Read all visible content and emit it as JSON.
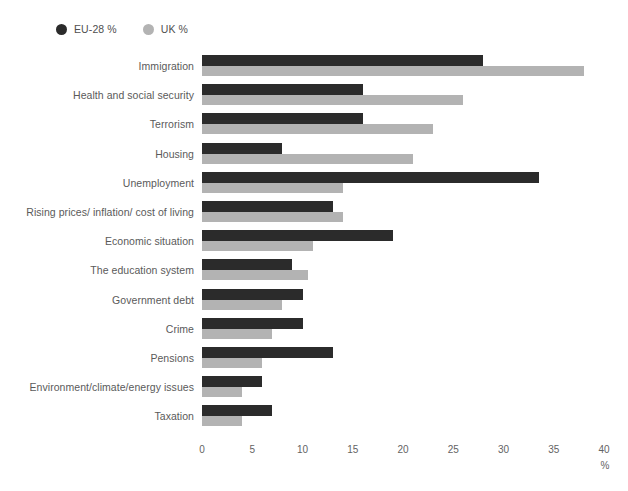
{
  "chart_data": {
    "type": "bar",
    "orientation": "horizontal",
    "title": "",
    "subtitle": "",
    "xlabel": "%",
    "ylabel": "",
    "xlim": [
      0,
      40
    ],
    "xticks": [
      0,
      5,
      10,
      15,
      20,
      25,
      30,
      35,
      40
    ],
    "grid": false,
    "legend_position": "top-left",
    "categories": [
      "Immigration",
      "Health and social security",
      "Terrorism",
      "Housing",
      "Unemployment",
      "Rising prices/ inflation/ cost of living",
      "Economic situation",
      "The education system",
      "Government debt",
      "Crime",
      "Pensions",
      "Environment/climate/energy issues",
      "Taxation"
    ],
    "series": [
      {
        "name": "EU-28 %",
        "color": "#2b2b2b",
        "values": [
          28,
          16,
          16,
          8,
          33.5,
          13,
          19,
          9,
          10,
          10,
          13,
          6,
          7
        ]
      },
      {
        "name": "UK %",
        "color": "#b3b3b3",
        "values": [
          38,
          26,
          23,
          21,
          14,
          14,
          11,
          10.5,
          8,
          7,
          6,
          4,
          4
        ]
      }
    ]
  },
  "legend": {
    "items": [
      {
        "label": "EU-28 %",
        "color": "#2b2b2b",
        "icon": "circle-marker-icon"
      },
      {
        "label": "UK %",
        "color": "#b3b3b3",
        "icon": "circle-marker-icon"
      }
    ]
  },
  "axis": {
    "unit_label": "%",
    "tick_labels": [
      "0",
      "5",
      "10",
      "15",
      "20",
      "25",
      "30",
      "35",
      "40"
    ]
  }
}
